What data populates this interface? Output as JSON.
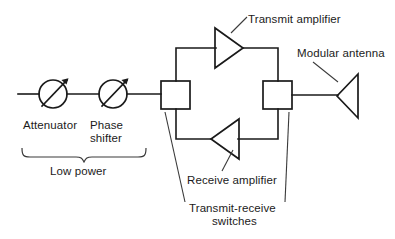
{
  "figure": {
    "type": "block-diagram",
    "background_color": "#ffffff",
    "line_color": "#1a1a1a",
    "text_color": "#1b1b1b"
  },
  "labels": {
    "attenuator": "Attenuator",
    "phase_shifter_line1": "Phase",
    "phase_shifter_line2": "shifter",
    "low_power": "Low power",
    "transmit_amplifier": "Transmit amplifier",
    "receive_amplifier": "Receive amplifier",
    "modular_antenna": "Modular antenna",
    "transmit_receive_line1": "Transmit-receive",
    "transmit_receive_line2": "switches"
  },
  "components": [
    {
      "id": "attenuator",
      "name": "Attenuator",
      "symbol": "circle-with-diagonal-arrow",
      "center": [
        53,
        94
      ],
      "radius": 14
    },
    {
      "id": "phase-shifter",
      "name": "Phase shifter",
      "symbol": "circle-with-diagonal-arrow",
      "center": [
        113,
        94
      ],
      "radius": 14
    },
    {
      "id": "tr-switch-left",
      "name": "Transmit-receive switch (left)",
      "symbol": "square-box",
      "box": [
        161,
        81,
        29,
        28
      ]
    },
    {
      "id": "tr-switch-right",
      "name": "Transmit-receive switch (right)",
      "symbol": "square-box",
      "box": [
        263,
        81,
        29,
        28
      ]
    },
    {
      "id": "transmit-amplifier",
      "name": "Transmit amplifier",
      "symbol": "triangle-pointing-right",
      "apex": [
        243,
        48
      ],
      "base_x": 215,
      "base_y_range": [
        28,
        68
      ]
    },
    {
      "id": "receive-amplifier",
      "name": "Receive amplifier",
      "symbol": "triangle-pointing-left",
      "apex": [
        211,
        139
      ],
      "base_x": 239,
      "base_y_range": [
        119,
        159
      ]
    },
    {
      "id": "modular-antenna",
      "name": "Modular antenna",
      "symbol": "triangle-pointing-left",
      "apex": [
        337,
        96
      ],
      "base_x": 358,
      "base_y_range": [
        74,
        118
      ]
    }
  ],
  "connections": [
    {
      "from": "input",
      "to": "attenuator",
      "path": "(18,94) -> (39,94)"
    },
    {
      "from": "attenuator",
      "to": "phase-shifter",
      "path": "(67,94) -> (99,94)"
    },
    {
      "from": "phase-shifter",
      "to": "tr-switch-left",
      "path": "(127,94) -> (161,94)"
    },
    {
      "from": "tr-switch-left",
      "to": "transmit-amplifier",
      "path": "(176,81) -> (176,48) -> (215,48)"
    },
    {
      "from": "transmit-amplifier",
      "to": "tr-switch-right",
      "path": "(243,48) -> (278,48) -> (278,81)"
    },
    {
      "from": "tr-switch-left",
      "to": "receive-amplifier",
      "path": "(176,109) -> (176,139) -> (211,139)"
    },
    {
      "from": "receive-amplifier",
      "to": "tr-switch-right",
      "path": "(239,139) -> (278,139) -> (278,109)"
    },
    {
      "from": "tr-switch-right",
      "to": "modular-antenna",
      "path": "(292,95) -> (337,95)"
    }
  ],
  "annotations": [
    {
      "label": "Transmit amplifier",
      "leader": "(247,18) -> (232,32)",
      "target": "transmit-amplifier"
    },
    {
      "label": "Modular antenna",
      "leader": "(313,63) -> (337,81)",
      "target": "modular-antenna"
    },
    {
      "label": "Receive amplifier",
      "leader": "(222,172) -> (232,152)",
      "target": "receive-amplifier"
    },
    {
      "label": "Transmit-receive switches",
      "leader_left": "(186,200) -> (166,113)",
      "leader_right": "(284,200) -> (288,113)",
      "target": "tr-switches"
    },
    {
      "label": "Low power",
      "brace": "x 22 to 145 at y 150, tip (84,162)",
      "target": "attenuator + phase-shifter"
    }
  ]
}
